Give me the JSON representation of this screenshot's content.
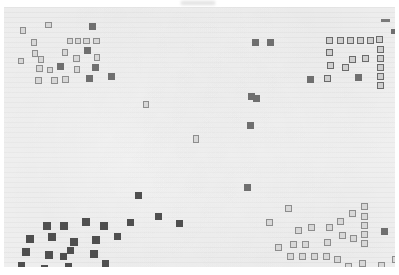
{
  "view": {
    "name": "document-thumbnail",
    "title": "Document page thumbnail",
    "zoom_level": "fit-page",
    "page_background": "#f2f2f2",
    "canvas_background": "#ffffff",
    "mark_color_solid": "#4f4f4f",
    "mark_color_mid": "#6f6f6f",
    "mark_color_hollow_fill": "#d8d8d8",
    "mark_color_hollow_border": "#8d8d8d",
    "text_line_color": "#969696"
  },
  "page": {
    "left": 4,
    "top": 7,
    "width": 391,
    "height": 260
  },
  "clusters": [
    {
      "name": "top-left-cluster",
      "label": "Top left annotation cluster",
      "count": 28
    },
    {
      "name": "top-right-cluster",
      "label": "Top right bracket cluster",
      "count": 20
    },
    {
      "name": "bottom-left-cluster",
      "label": "Bottom left annotation cluster",
      "count": 22
    },
    {
      "name": "bottom-right-cluster",
      "label": "Bottom right bracket cluster",
      "count": 24
    },
    {
      "name": "center-sparse",
      "label": "Sparse center marks",
      "count": 8
    }
  ],
  "marks": [
    {
      "x": 16,
      "y": 20,
      "w": 6,
      "h": 7,
      "style": "hollow"
    },
    {
      "x": 41,
      "y": 15,
      "w": 7,
      "h": 6,
      "style": "hollow"
    },
    {
      "x": 85,
      "y": 16,
      "w": 7,
      "h": 7,
      "style": "mid"
    },
    {
      "x": 27,
      "y": 32,
      "w": 6,
      "h": 7,
      "style": "hollow"
    },
    {
      "x": 63,
      "y": 31,
      "w": 6,
      "h": 6,
      "style": "hollow"
    },
    {
      "x": 71,
      "y": 31,
      "w": 6,
      "h": 6,
      "style": "hollow"
    },
    {
      "x": 79,
      "y": 31,
      "w": 7,
      "h": 6,
      "style": "hollow"
    },
    {
      "x": 89,
      "y": 31,
      "w": 7,
      "h": 6,
      "style": "hollow"
    },
    {
      "x": 28,
      "y": 43,
      "w": 6,
      "h": 7,
      "style": "hollow"
    },
    {
      "x": 58,
      "y": 42,
      "w": 6,
      "h": 7,
      "style": "hollow"
    },
    {
      "x": 80,
      "y": 40,
      "w": 7,
      "h": 7,
      "style": "mid"
    },
    {
      "x": 14,
      "y": 51,
      "w": 6,
      "h": 6,
      "style": "hollow"
    },
    {
      "x": 34,
      "y": 49,
      "w": 6,
      "h": 7,
      "style": "hollow"
    },
    {
      "x": 69,
      "y": 48,
      "w": 7,
      "h": 7,
      "style": "hollow"
    },
    {
      "x": 90,
      "y": 47,
      "w": 6,
      "h": 7,
      "style": "hollow"
    },
    {
      "x": 32,
      "y": 58,
      "w": 7,
      "h": 7,
      "style": "hollow"
    },
    {
      "x": 43,
      "y": 60,
      "w": 6,
      "h": 6,
      "style": "hollow"
    },
    {
      "x": 53,
      "y": 56,
      "w": 7,
      "h": 7,
      "style": "mid"
    },
    {
      "x": 70,
      "y": 59,
      "w": 6,
      "h": 7,
      "style": "hollow"
    },
    {
      "x": 88,
      "y": 57,
      "w": 7,
      "h": 7,
      "style": "mid"
    },
    {
      "x": 31,
      "y": 70,
      "w": 7,
      "h": 7,
      "style": "hollow"
    },
    {
      "x": 47,
      "y": 70,
      "w": 7,
      "h": 7,
      "style": "hollow"
    },
    {
      "x": 58,
      "y": 69,
      "w": 7,
      "h": 7,
      "style": "hollow"
    },
    {
      "x": 82,
      "y": 68,
      "w": 7,
      "h": 7,
      "style": "mid"
    },
    {
      "x": 104,
      "y": 66,
      "w": 7,
      "h": 7,
      "style": "mid"
    },
    {
      "x": 139,
      "y": 94,
      "w": 6,
      "h": 7,
      "style": "hollow"
    },
    {
      "x": 189,
      "y": 128,
      "w": 6,
      "h": 8,
      "style": "hollow"
    },
    {
      "x": 243,
      "y": 115,
      "w": 7,
      "h": 7,
      "style": "mid"
    },
    {
      "x": 244,
      "y": 86,
      "w": 7,
      "h": 7,
      "style": "mid"
    },
    {
      "x": 248,
      "y": 32,
      "w": 7,
      "h": 7,
      "style": "mid"
    },
    {
      "x": 263,
      "y": 32,
      "w": 7,
      "h": 7,
      "style": "mid"
    },
    {
      "x": 249,
      "y": 88,
      "w": 7,
      "h": 7,
      "style": "mid"
    },
    {
      "x": 303,
      "y": 69,
      "w": 7,
      "h": 7,
      "style": "mid"
    },
    {
      "x": 377,
      "y": 12,
      "w": 9,
      "h": 3,
      "style": "dash"
    },
    {
      "x": 387,
      "y": 22,
      "w": 6,
      "h": 5,
      "style": "mid"
    },
    {
      "x": 322,
      "y": 30,
      "w": 7,
      "h": 7,
      "style": "hollow-dark"
    },
    {
      "x": 333,
      "y": 30,
      "w": 7,
      "h": 7,
      "style": "hollow-dark"
    },
    {
      "x": 343,
      "y": 30,
      "w": 7,
      "h": 7,
      "style": "hollow-dark"
    },
    {
      "x": 353,
      "y": 30,
      "w": 7,
      "h": 7,
      "style": "hollow-dark"
    },
    {
      "x": 363,
      "y": 30,
      "w": 7,
      "h": 7,
      "style": "hollow-dark"
    },
    {
      "x": 372,
      "y": 29,
      "w": 7,
      "h": 7,
      "style": "hollow-dark"
    },
    {
      "x": 373,
      "y": 39,
      "w": 7,
      "h": 7,
      "style": "hollow-dark"
    },
    {
      "x": 373,
      "y": 48,
      "w": 7,
      "h": 7,
      "style": "hollow-dark"
    },
    {
      "x": 373,
      "y": 57,
      "w": 7,
      "h": 7,
      "style": "hollow-dark"
    },
    {
      "x": 373,
      "y": 66,
      "w": 7,
      "h": 7,
      "style": "hollow-dark"
    },
    {
      "x": 373,
      "y": 75,
      "w": 7,
      "h": 7,
      "style": "hollow-dark"
    },
    {
      "x": 322,
      "y": 42,
      "w": 7,
      "h": 7,
      "style": "hollow-dark"
    },
    {
      "x": 323,
      "y": 55,
      "w": 7,
      "h": 7,
      "style": "hollow-dark"
    },
    {
      "x": 338,
      "y": 57,
      "w": 7,
      "h": 7,
      "style": "hollow-dark"
    },
    {
      "x": 345,
      "y": 49,
      "w": 7,
      "h": 7,
      "style": "hollow-dark"
    },
    {
      "x": 358,
      "y": 48,
      "w": 7,
      "h": 7,
      "style": "hollow-dark"
    },
    {
      "x": 320,
      "y": 68,
      "w": 7,
      "h": 7,
      "style": "hollow-dark"
    },
    {
      "x": 351,
      "y": 67,
      "w": 7,
      "h": 7,
      "style": "mid"
    },
    {
      "x": 131,
      "y": 185,
      "w": 7,
      "h": 7,
      "style": "solid"
    },
    {
      "x": 151,
      "y": 206,
      "w": 7,
      "h": 7,
      "style": "solid"
    },
    {
      "x": 172,
      "y": 213,
      "w": 7,
      "h": 7,
      "style": "solid"
    },
    {
      "x": 240,
      "y": 177,
      "w": 7,
      "h": 7,
      "style": "mid"
    },
    {
      "x": 39,
      "y": 215,
      "w": 8,
      "h": 8,
      "style": "solid"
    },
    {
      "x": 56,
      "y": 215,
      "w": 8,
      "h": 8,
      "style": "solid"
    },
    {
      "x": 78,
      "y": 211,
      "w": 8,
      "h": 8,
      "style": "solid"
    },
    {
      "x": 96,
      "y": 215,
      "w": 8,
      "h": 8,
      "style": "solid"
    },
    {
      "x": 123,
      "y": 212,
      "w": 7,
      "h": 7,
      "style": "solid"
    },
    {
      "x": 22,
      "y": 228,
      "w": 8,
      "h": 8,
      "style": "solid"
    },
    {
      "x": 44,
      "y": 226,
      "w": 8,
      "h": 8,
      "style": "solid"
    },
    {
      "x": 66,
      "y": 231,
      "w": 8,
      "h": 8,
      "style": "solid"
    },
    {
      "x": 88,
      "y": 229,
      "w": 8,
      "h": 8,
      "style": "solid"
    },
    {
      "x": 110,
      "y": 226,
      "w": 7,
      "h": 7,
      "style": "solid"
    },
    {
      "x": 18,
      "y": 241,
      "w": 8,
      "h": 8,
      "style": "solid"
    },
    {
      "x": 41,
      "y": 244,
      "w": 8,
      "h": 8,
      "style": "solid"
    },
    {
      "x": 56,
      "y": 246,
      "w": 7,
      "h": 7,
      "style": "solid"
    },
    {
      "x": 63,
      "y": 240,
      "w": 7,
      "h": 7,
      "style": "solid"
    },
    {
      "x": 86,
      "y": 243,
      "w": 8,
      "h": 8,
      "style": "solid"
    },
    {
      "x": 98,
      "y": 253,
      "w": 7,
      "h": 7,
      "style": "solid"
    },
    {
      "x": 14,
      "y": 255,
      "w": 7,
      "h": 7,
      "style": "solid"
    },
    {
      "x": 37,
      "y": 258,
      "w": 7,
      "h": 7,
      "style": "solid"
    },
    {
      "x": 61,
      "y": 256,
      "w": 7,
      "h": 7,
      "style": "solid"
    },
    {
      "x": 357,
      "y": 196,
      "w": 7,
      "h": 7,
      "style": "hollow"
    },
    {
      "x": 357,
      "y": 206,
      "w": 7,
      "h": 7,
      "style": "hollow"
    },
    {
      "x": 357,
      "y": 215,
      "w": 7,
      "h": 7,
      "style": "hollow"
    },
    {
      "x": 357,
      "y": 224,
      "w": 7,
      "h": 7,
      "style": "hollow"
    },
    {
      "x": 357,
      "y": 233,
      "w": 7,
      "h": 7,
      "style": "hollow"
    },
    {
      "x": 333,
      "y": 211,
      "w": 7,
      "h": 7,
      "style": "hollow"
    },
    {
      "x": 345,
      "y": 203,
      "w": 7,
      "h": 7,
      "style": "hollow"
    },
    {
      "x": 322,
      "y": 217,
      "w": 7,
      "h": 7,
      "style": "hollow"
    },
    {
      "x": 335,
      "y": 225,
      "w": 7,
      "h": 7,
      "style": "hollow"
    },
    {
      "x": 346,
      "y": 228,
      "w": 7,
      "h": 7,
      "style": "hollow"
    },
    {
      "x": 320,
      "y": 232,
      "w": 7,
      "h": 7,
      "style": "hollow"
    },
    {
      "x": 291,
      "y": 220,
      "w": 7,
      "h": 7,
      "style": "hollow"
    },
    {
      "x": 304,
      "y": 217,
      "w": 7,
      "h": 7,
      "style": "hollow"
    },
    {
      "x": 286,
      "y": 234,
      "w": 7,
      "h": 7,
      "style": "hollow"
    },
    {
      "x": 298,
      "y": 234,
      "w": 7,
      "h": 7,
      "style": "hollow"
    },
    {
      "x": 271,
      "y": 237,
      "w": 7,
      "h": 7,
      "style": "hollow"
    },
    {
      "x": 283,
      "y": 246,
      "w": 7,
      "h": 7,
      "style": "hollow"
    },
    {
      "x": 295,
      "y": 246,
      "w": 7,
      "h": 7,
      "style": "hollow"
    },
    {
      "x": 307,
      "y": 246,
      "w": 7,
      "h": 7,
      "style": "hollow"
    },
    {
      "x": 319,
      "y": 246,
      "w": 7,
      "h": 7,
      "style": "hollow"
    },
    {
      "x": 330,
      "y": 249,
      "w": 7,
      "h": 7,
      "style": "hollow"
    },
    {
      "x": 341,
      "y": 256,
      "w": 7,
      "h": 7,
      "style": "hollow"
    },
    {
      "x": 355,
      "y": 253,
      "w": 7,
      "h": 7,
      "style": "hollow"
    },
    {
      "x": 281,
      "y": 198,
      "w": 7,
      "h": 7,
      "style": "hollow"
    },
    {
      "x": 262,
      "y": 212,
      "w": 7,
      "h": 7,
      "style": "hollow"
    },
    {
      "x": 377,
      "y": 221,
      "w": 7,
      "h": 7,
      "style": "mid"
    },
    {
      "x": 374,
      "y": 255,
      "w": 7,
      "h": 7,
      "style": "hollow"
    },
    {
      "x": 388,
      "y": 249,
      "w": 6,
      "h": 7,
      "style": "hollow"
    }
  ]
}
